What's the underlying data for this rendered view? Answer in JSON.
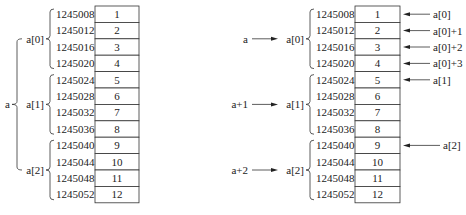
{
  "diagrams": [
    {
      "name": "left-memory-layout",
      "box_x": 95,
      "box_w": 44,
      "top_y": 6,
      "row_h": 16.4,
      "addr_x": 56,
      "cells": [
        {
          "address": "1245008",
          "value": "1"
        },
        {
          "address": "1245012",
          "value": "2"
        },
        {
          "address": "1245016",
          "value": "3"
        },
        {
          "address": "1245020",
          "value": "4"
        },
        {
          "address": "1245024",
          "value": "5"
        },
        {
          "address": "1245028",
          "value": "6"
        },
        {
          "address": "1245032",
          "value": "7"
        },
        {
          "address": "1245036",
          "value": "8"
        },
        {
          "address": "1245040",
          "value": "9"
        },
        {
          "address": "1245044",
          "value": "10"
        },
        {
          "address": "1245048",
          "value": "11"
        },
        {
          "address": "1245052",
          "value": "12"
        }
      ],
      "row_groups": [
        {
          "label": "a[0]",
          "rows": [
            0,
            3
          ]
        },
        {
          "label": "a[1]",
          "rows": [
            4,
            7
          ]
        },
        {
          "label": "a[2]",
          "rows": [
            8,
            11
          ]
        }
      ],
      "outer_label": "a",
      "left_pointers": [],
      "right_pointers": []
    },
    {
      "name": "right-memory-layout-with-pointers",
      "box_x": 355,
      "box_w": 45,
      "top_y": 6,
      "row_h": 16.4,
      "addr_x": 316,
      "cells": [
        {
          "address": "1245008",
          "value": "1"
        },
        {
          "address": "1245012",
          "value": "2"
        },
        {
          "address": "1245016",
          "value": "3"
        },
        {
          "address": "1245020",
          "value": "4"
        },
        {
          "address": "1245024",
          "value": "5"
        },
        {
          "address": "1245028",
          "value": "6"
        },
        {
          "address": "1245032",
          "value": "7"
        },
        {
          "address": "1245036",
          "value": "8"
        },
        {
          "address": "1245040",
          "value": "9"
        },
        {
          "address": "1245044",
          "value": "10"
        },
        {
          "address": "1245048",
          "value": "11"
        },
        {
          "address": "1245052",
          "value": "12"
        }
      ],
      "row_groups": [
        {
          "label": "a[0]",
          "rows": [
            0,
            3
          ]
        },
        {
          "label": "a[1]",
          "rows": [
            4,
            7
          ]
        },
        {
          "label": "a[2]",
          "rows": [
            8,
            11
          ]
        }
      ],
      "outer_label": "",
      "left_pointers": [
        {
          "label": "a",
          "group": 0
        },
        {
          "label": "a+1",
          "group": 1
        },
        {
          "label": "a+2",
          "group": 2
        }
      ],
      "right_pointers": [
        {
          "label": "a[0]",
          "row": 0
        },
        {
          "label": "a[0]+1",
          "row": 1
        },
        {
          "label": "a[0]+2",
          "row": 2
        },
        {
          "label": "a[0]+3",
          "row": 3
        },
        {
          "label": "a[1]",
          "row": 4
        },
        {
          "label": "a[2]",
          "row": 8,
          "long": true
        }
      ]
    }
  ],
  "captions": [
    {
      "text": "",
      "x": 60
    },
    {
      "text": "",
      "x": 300
    }
  ]
}
